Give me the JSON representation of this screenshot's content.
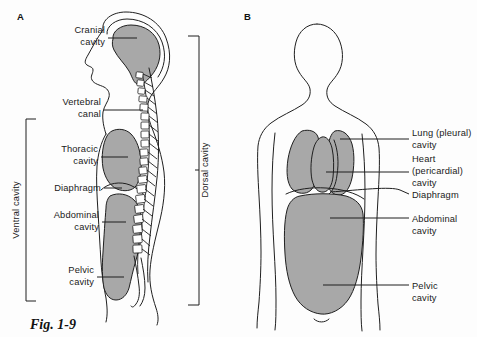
{
  "figure": {
    "caption": "Fig. 1-9",
    "panels": [
      {
        "id": "A",
        "letter": "A"
      },
      {
        "id": "B",
        "letter": "B"
      }
    ]
  },
  "colors": {
    "cavity_gray": "#a8a8a8",
    "outline": "#1f1f1f",
    "background": "#fdfdfd",
    "text": "#1a1a1a"
  },
  "panel_a": {
    "letter": "A",
    "labels": [
      {
        "id": "cranial",
        "line1": "Cranial",
        "line2": "cavity"
      },
      {
        "id": "vertebral",
        "line1": "Vertebral",
        "line2": "canal"
      },
      {
        "id": "thoracic",
        "line1": "Thoracic",
        "line2": "cavity"
      },
      {
        "id": "diaphragm",
        "line1": "Diaphragm",
        "line2": ""
      },
      {
        "id": "abdominal",
        "line1": "Abdominal",
        "line2": "cavity"
      },
      {
        "id": "pelvic",
        "line1": "Pelvic",
        "line2": "cavity"
      }
    ],
    "brackets": [
      {
        "id": "ventral",
        "label": "Ventral cavity",
        "side": "left"
      },
      {
        "id": "dorsal",
        "label": "Dorsal cavity",
        "side": "right"
      }
    ]
  },
  "panel_b": {
    "letter": "B",
    "labels": [
      {
        "id": "lung",
        "line1": "Lung (pleural)",
        "line2": "cavity",
        "line3": ""
      },
      {
        "id": "heart",
        "line1": "Heart",
        "line2": "(pericardial)",
        "line3": "cavity"
      },
      {
        "id": "diaphragm",
        "line1": "Diaphragm",
        "line2": "",
        "line3": ""
      },
      {
        "id": "abdominal",
        "line1": "Abdominal",
        "line2": "cavity",
        "line3": ""
      },
      {
        "id": "pelvic",
        "line1": "Pelvic",
        "line2": "cavity",
        "line3": ""
      }
    ]
  }
}
